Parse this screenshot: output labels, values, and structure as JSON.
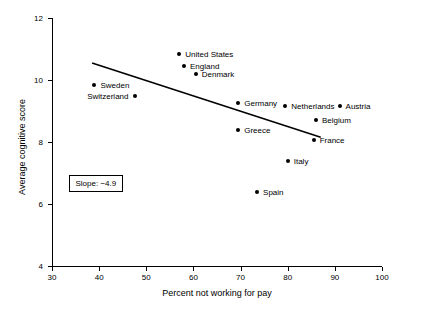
{
  "chart_data": {
    "type": "scatter",
    "title": "",
    "xlabel": "Percent not working for pay",
    "ylabel": "Average cognitive score",
    "xlim": [
      30,
      100
    ],
    "ylim": [
      4,
      12
    ],
    "xticks": [
      "30",
      "40",
      "50",
      "60",
      "70",
      "80",
      "90",
      "100"
    ],
    "yticks": [
      "4",
      "6",
      "8",
      "10",
      "12"
    ],
    "grid": false,
    "legend": "none",
    "annotations": [
      {
        "name": "slope-note",
        "text": "Slope: −4.9"
      }
    ],
    "trend_line": {
      "x_start": 38.5,
      "y_start": 10.55,
      "x_end": 87.0,
      "y_end": 8.15
    },
    "points": [
      {
        "label": "United States",
        "x": 57.0,
        "y": 10.85,
        "label_side": "right"
      },
      {
        "label": "England",
        "x": 58.0,
        "y": 10.45,
        "label_side": "right"
      },
      {
        "label": "Denmark",
        "x": 60.5,
        "y": 10.2,
        "label_side": "right"
      },
      {
        "label": "Sweden",
        "x": 39.0,
        "y": 9.85,
        "label_side": "right"
      },
      {
        "label": "Switzerland",
        "x": 47.5,
        "y": 9.5,
        "label_side": "left"
      },
      {
        "label": "Germany",
        "x": 69.5,
        "y": 9.25,
        "label_side": "right"
      },
      {
        "label": "Netherlands",
        "x": 79.5,
        "y": 9.15,
        "label_side": "right"
      },
      {
        "label": "Austria",
        "x": 91.0,
        "y": 9.15,
        "label_side": "right"
      },
      {
        "label": "Belgium",
        "x": 86.0,
        "y": 8.7,
        "label_side": "right"
      },
      {
        "label": "Greece",
        "x": 69.5,
        "y": 8.4,
        "label_side": "right"
      },
      {
        "label": "France",
        "x": 85.5,
        "y": 8.05,
        "label_side": "right"
      },
      {
        "label": "Italy",
        "x": 80.0,
        "y": 7.4,
        "label_side": "right"
      },
      {
        "label": "Spain",
        "x": 73.5,
        "y": 6.4,
        "label_side": "right"
      }
    ]
  }
}
